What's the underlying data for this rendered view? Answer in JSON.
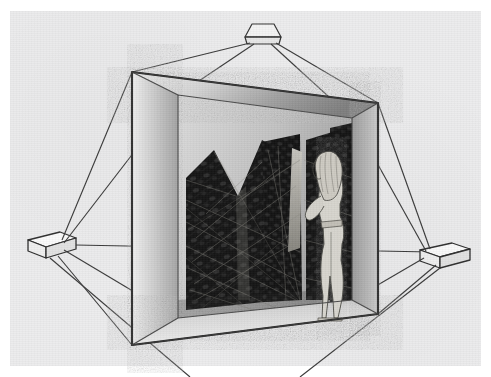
{
  "artwork": {
    "title": "Suspended open cube with cave interior and standing figure",
    "medium": "pen-and-ink / airbrush illustration, greyscale",
    "background_color": "#ececed",
    "paper_margin_color": "#ffffff",
    "line_color": "#2b2b2b",
    "wall_light": "#e8e8e8",
    "wall_mid": "#b9b9b9",
    "wall_dark": "#8f8f8f",
    "cave_color": "#1a1a1a",
    "figure_color": "#d8d6cf"
  },
  "elements": {
    "outer_frame_label": "suspension wireframe",
    "cube_label": "open cube enclosure",
    "cave_label": "dark jagged cave interior",
    "figure_label": "standing human figure in profile",
    "anchors": [
      {
        "name": "top-anchor-block",
        "x": 262,
        "y": 32
      },
      {
        "name": "left-anchor-block",
        "x": 44,
        "y": 245
      },
      {
        "name": "right-anchor-block",
        "x": 447,
        "y": 256
      }
    ],
    "cube_corners": {
      "front_top_left": [
        132,
        72
      ],
      "front_top_right": [
        378,
        103
      ],
      "front_bottom_right": [
        378,
        314
      ],
      "front_bottom_left": [
        132,
        345
      ],
      "back_top_left": [
        178,
        95
      ],
      "back_top_right": [
        352,
        118
      ],
      "back_bottom_right": [
        352,
        300
      ],
      "back_bottom_left": [
        178,
        318
      ]
    }
  }
}
